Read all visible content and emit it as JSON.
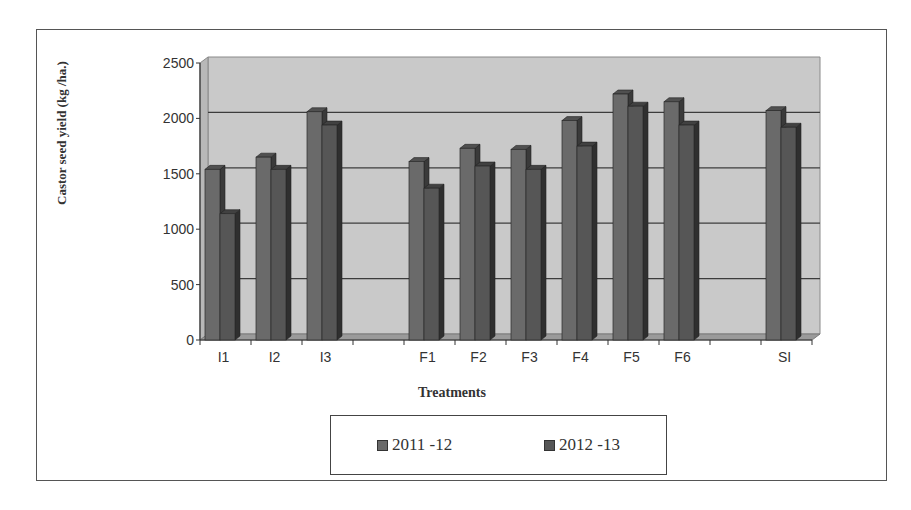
{
  "chart_data": {
    "type": "bar",
    "style": "3d-clustered-column",
    "title": "",
    "xlabel": "Treatments",
    "ylabel": "Castor seed yield (kg /ha.)",
    "ylim": [
      0,
      2500
    ],
    "yticks": [
      0,
      500,
      1000,
      1500,
      2000,
      2500
    ],
    "grid": true,
    "legend_position": "bottom",
    "categories": [
      "I1",
      "I2",
      "I3",
      "",
      "F1",
      "F2",
      "F3",
      "F4",
      "F5",
      "F6",
      "",
      "SI"
    ],
    "series": [
      {
        "name": "2011 -12",
        "color": "#6a6a6a",
        "values": [
          1540,
          1650,
          2060,
          null,
          1610,
          1730,
          1720,
          1980,
          2220,
          2150,
          null,
          2070
        ]
      },
      {
        "name": "2012 -13",
        "color": "#565656",
        "values": [
          1140,
          1540,
          1940,
          null,
          1370,
          1570,
          1540,
          1750,
          2110,
          1940,
          null,
          1920
        ]
      }
    ]
  },
  "legend": {
    "items": [
      {
        "label": "2011 -12",
        "color": "#6a6a6a"
      },
      {
        "label": "2012 -13",
        "color": "#565656"
      }
    ]
  }
}
